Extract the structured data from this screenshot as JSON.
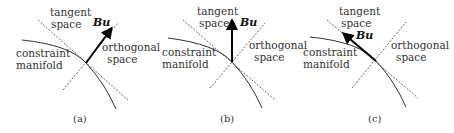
{
  "figure": {
    "panels": [
      {
        "id": "a",
        "caption": "(a)",
        "tangent_label": [
          "tangent",
          "space"
        ],
        "orthogonal_label": [
          "orthogonal",
          "space"
        ],
        "manifold_label": [
          "constraint",
          "manifold"
        ],
        "vector_label": "Bu",
        "vector_direction": "along orthogonal space"
      },
      {
        "id": "b",
        "caption": "(b)",
        "tangent_label": [
          "tangent",
          "space"
        ],
        "orthogonal_label": [
          "orthogonal",
          "space"
        ],
        "manifold_label": [
          "constraint",
          "manifold"
        ],
        "vector_label": "Bu",
        "vector_direction": "vertical, between tangent and orthogonal"
      },
      {
        "id": "c",
        "caption": "(c)",
        "tangent_label": [
          "tangent",
          "space"
        ],
        "orthogonal_label": [
          "orthogonal",
          "space"
        ],
        "manifold_label": [
          "constraint",
          "manifold"
        ],
        "vector_label": "Bu",
        "vector_direction": "along tangent space"
      }
    ]
  }
}
